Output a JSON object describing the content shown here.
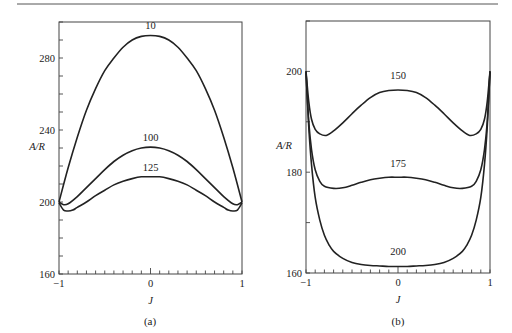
{
  "figure": {
    "panels_caption": [
      "(a)",
      "(b)"
    ]
  },
  "chart_data": [
    {
      "type": "line",
      "panel": "(a)",
      "xlabel": "J",
      "ylabel": "A/R",
      "xlim": [
        -1,
        1
      ],
      "ylim": [
        160,
        300
      ],
      "xticks": [
        "-1",
        "0",
        "1"
      ],
      "yticks": [
        "160",
        "200",
        "240",
        "280"
      ],
      "y_minor_step": 10,
      "x_minor_step": 0.1,
      "grid": false,
      "series": [
        {
          "name": "10",
          "x": [
            -1,
            -0.9,
            -0.8,
            -0.7,
            -0.6,
            -0.5,
            -0.4,
            -0.3,
            -0.2,
            -0.1,
            0,
            0.1,
            0.2,
            0.3,
            0.4,
            0.5,
            0.6,
            0.7,
            0.8,
            0.9,
            1
          ],
          "values": [
            200,
            219,
            236,
            251,
            263,
            273,
            280,
            286,
            290,
            292,
            292.5,
            292,
            290,
            286,
            280,
            273,
            263,
            251,
            236,
            219,
            200
          ],
          "label_pos": [
            0,
            296
          ]
        },
        {
          "name": "100",
          "x": [
            -1,
            -0.95,
            -0.9,
            -0.8,
            -0.7,
            -0.6,
            -0.5,
            -0.4,
            -0.3,
            -0.2,
            -0.1,
            0,
            0.1,
            0.2,
            0.3,
            0.4,
            0.5,
            0.6,
            0.7,
            0.8,
            0.9,
            0.95,
            1
          ],
          "values": [
            200,
            198.5,
            199,
            203,
            208,
            213,
            218,
            222.5,
            226,
            228.5,
            230,
            230.5,
            230,
            228.5,
            226,
            222.5,
            218,
            213,
            208,
            203,
            199,
            198.5,
            200
          ],
          "label_pos": [
            0,
            234
          ]
        },
        {
          "name": "125",
          "x": [
            -1,
            -0.95,
            -0.9,
            -0.85,
            -0.8,
            -0.7,
            -0.6,
            -0.5,
            -0.4,
            -0.3,
            -0.2,
            -0.1,
            0,
            0.1,
            0.2,
            0.3,
            0.4,
            0.5,
            0.6,
            0.7,
            0.8,
            0.85,
            0.9,
            0.95,
            1
          ],
          "values": [
            199.5,
            195.5,
            195,
            195.5,
            197,
            200,
            203.5,
            206.5,
            209.5,
            211.5,
            213,
            214,
            214,
            214,
            213,
            211.5,
            209.5,
            206.5,
            203.5,
            200,
            197,
            195.5,
            195,
            195.5,
            199.5
          ],
          "label_pos": [
            0,
            217.5
          ]
        }
      ]
    },
    {
      "type": "line",
      "panel": "(b)",
      "xlabel": "J",
      "ylabel": "A/R",
      "xlim": [
        -1,
        1
      ],
      "ylim": [
        160,
        210
      ],
      "xticks": [
        "-1",
        "0",
        "1"
      ],
      "yticks": [
        "160",
        "180",
        "200"
      ],
      "y_minor_step": 10,
      "x_minor_step": 0.1,
      "grid": false,
      "series": [
        {
          "name": "150",
          "x": [
            -1,
            -0.97,
            -0.94,
            -0.9,
            -0.85,
            -0.78,
            -0.7,
            -0.6,
            -0.5,
            -0.4,
            -0.3,
            -0.2,
            -0.1,
            0,
            0.1,
            0.2,
            0.3,
            0.4,
            0.5,
            0.6,
            0.7,
            0.78,
            0.85,
            0.9,
            0.94,
            0.97,
            1
          ],
          "values": [
            200,
            194,
            190.5,
            188.5,
            187.6,
            187.3,
            188.2,
            189.8,
            191.6,
            193.3,
            194.8,
            195.8,
            196.2,
            196.3,
            196.2,
            195.8,
            194.8,
            193.3,
            191.6,
            189.8,
            188.2,
            187.3,
            187.6,
            188.5,
            190.5,
            194,
            200
          ],
          "label_pos": [
            0,
            198.5
          ]
        },
        {
          "name": "175",
          "x": [
            -1,
            -0.97,
            -0.94,
            -0.9,
            -0.85,
            -0.8,
            -0.7,
            -0.6,
            -0.5,
            -0.4,
            -0.3,
            -0.2,
            -0.1,
            0,
            0.1,
            0.2,
            0.3,
            0.4,
            0.5,
            0.6,
            0.7,
            0.8,
            0.85,
            0.9,
            0.94,
            0.97,
            1
          ],
          "values": [
            200,
            190,
            184.5,
            180.5,
            178.2,
            177.2,
            176.8,
            176.9,
            177.4,
            178.0,
            178.5,
            178.8,
            179.0,
            179.0,
            179.0,
            178.8,
            178.5,
            178.0,
            177.4,
            176.9,
            176.8,
            177.2,
            178.2,
            180.5,
            184.5,
            190,
            200
          ],
          "label_pos": [
            0,
            181
          ]
        },
        {
          "name": "200",
          "x": [
            -1,
            -0.97,
            -0.94,
            -0.9,
            -0.85,
            -0.8,
            -0.75,
            -0.7,
            -0.6,
            -0.5,
            -0.4,
            -0.3,
            -0.2,
            -0.1,
            0,
            0.1,
            0.2,
            0.3,
            0.4,
            0.5,
            0.6,
            0.7,
            0.75,
            0.8,
            0.85,
            0.9,
            0.94,
            0.97,
            1
          ],
          "values": [
            200,
            189,
            181.5,
            175,
            170.5,
            167.5,
            165.6,
            164.3,
            162.9,
            162.1,
            161.7,
            161.5,
            161.4,
            161.3,
            161.3,
            161.3,
            161.4,
            161.5,
            161.7,
            162.1,
            162.9,
            164.3,
            165.6,
            167.5,
            170.5,
            175,
            181.5,
            189,
            200
          ],
          "label_pos": [
            0,
            163.5
          ]
        }
      ]
    }
  ]
}
